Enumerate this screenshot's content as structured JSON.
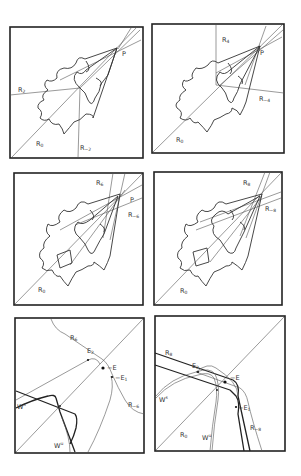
{
  "figure": {
    "panels": [
      {
        "id": "a",
        "labels": {
          "r_pos": "R2",
          "r_neg": "R-2",
          "r0": "R0",
          "point": "P"
        }
      },
      {
        "id": "b",
        "labels": {
          "r_pos": "R4",
          "r_neg": "R-4",
          "r0": "R0",
          "point": "P"
        }
      },
      {
        "id": "c",
        "labels": {
          "r_pos": "R6",
          "r_neg": "R-6",
          "r0": "R0",
          "point": "P"
        }
      },
      {
        "id": "d",
        "labels": {
          "r_pos": "R8",
          "r_neg": "R-8",
          "r0": "R0"
        }
      },
      {
        "id": "e",
        "labels": {
          "r_pos": "R6",
          "r_neg": "R-6",
          "e": "E",
          "e1": "E1",
          "e2": "E2",
          "ws": "Ws",
          "wu": "Wu"
        }
      },
      {
        "id": "f",
        "labels": {
          "r_pos": "R8",
          "r_neg": "R-8",
          "r0": "R0",
          "e": "E",
          "e1": "E1",
          "e2": "E2",
          "ws": "Ws",
          "wu": "Wu"
        }
      }
    ]
  }
}
